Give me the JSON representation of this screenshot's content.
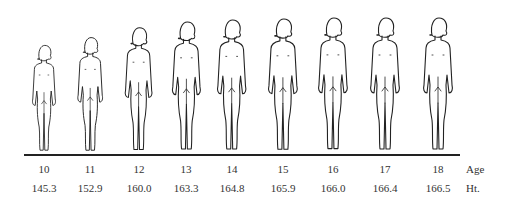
{
  "figures": [
    {
      "age": "10",
      "height": "145.3",
      "x": 44,
      "top": 36,
      "scale": 0.8
    },
    {
      "age": "11",
      "height": "152.9",
      "x": 90,
      "top": 31,
      "scale": 0.86
    },
    {
      "age": "12",
      "height": "160.0",
      "x": 139,
      "top": 23,
      "scale": 0.93
    },
    {
      "age": "13",
      "height": "163.3",
      "x": 186,
      "top": 19,
      "scale": 0.97
    },
    {
      "age": "14",
      "height": "164.8",
      "x": 232,
      "top": 17,
      "scale": 0.985
    },
    {
      "age": "15",
      "height": "165.9",
      "x": 283,
      "top": 16,
      "scale": 0.995
    },
    {
      "age": "16",
      "height": "166.0",
      "x": 333,
      "top": 16,
      "scale": 0.997
    },
    {
      "age": "17",
      "height": "166.4",
      "x": 385,
      "top": 15,
      "scale": 1.0
    },
    {
      "age": "18",
      "height": "166.5",
      "x": 438,
      "top": 14,
      "scale": 1.0
    }
  ],
  "labels": {
    "age_row": "Age",
    "height_row": "Ht."
  },
  "colors": {
    "line": "#222222",
    "background": "#ffffff"
  }
}
